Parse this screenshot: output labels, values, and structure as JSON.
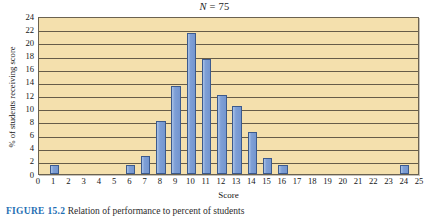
{
  "figure": {
    "caption_label": "FIGURE 15.2",
    "caption_text": "Relation of performance to percent of students"
  },
  "chart_data": {
    "type": "bar",
    "title": "N = 75",
    "title_italic_part": "N",
    "title_value": "= 75",
    "xlabel": "Score",
    "ylabel": "% of students receiving score",
    "categories": [
      "0",
      "1",
      "2",
      "3",
      "4",
      "5",
      "6",
      "7",
      "8",
      "9",
      "10",
      "11",
      "12",
      "13",
      "14",
      "15",
      "16",
      "17",
      "18",
      "19",
      "20",
      "21",
      "22",
      "23",
      "24",
      "25"
    ],
    "values": [
      0,
      1.4,
      0,
      0,
      0,
      0,
      1.4,
      2.7,
      8.0,
      13.4,
      21.4,
      17.4,
      12.0,
      10.3,
      6.4,
      2.4,
      1.4,
      0,
      0,
      0,
      0,
      0,
      0,
      0,
      1.3,
      0
    ],
    "ylim": [
      0,
      24
    ],
    "ytick_labels": [
      "0",
      "2",
      "4",
      "6",
      "8",
      "10",
      "12",
      "14",
      "16",
      "18",
      "20",
      "22",
      "24"
    ],
    "ytick_values": [
      0,
      2,
      4,
      6,
      8,
      10,
      12,
      14,
      16,
      18,
      20,
      22,
      24
    ],
    "xtick_labels": [
      "0",
      "1",
      "2",
      "3",
      "4",
      "5",
      "6",
      "7",
      "8",
      "9",
      "10",
      "11",
      "12",
      "13",
      "14",
      "15",
      "16",
      "17",
      "18",
      "19",
      "20",
      "21",
      "22",
      "23",
      "24",
      "25"
    ],
    "grid": true,
    "legend": null,
    "bar_color": "#7e9fd6",
    "bar_edge_color": "#3c5a8c",
    "plot_background": "#f4e0ad",
    "axis_color": "#4c4436"
  }
}
